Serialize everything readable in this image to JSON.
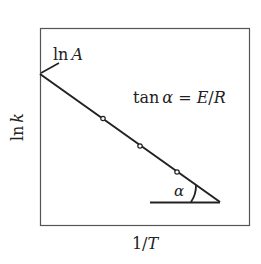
{
  "diagram": {
    "type": "arrhenius-plot",
    "y_axis_label": {
      "fn": "ln",
      "var": "k"
    },
    "x_axis_label": {
      "num": "1/",
      "var": "T"
    },
    "intercept_label": {
      "fn": "ln",
      "var": "A"
    },
    "slope_equation": {
      "fn": "tan",
      "angle": "α",
      "eq": " = ",
      "lhs": "E",
      "sep": "/",
      "rhs": "R"
    },
    "angle_label": "α",
    "line_color": "#222222",
    "points": [
      {
        "x": 103,
        "y": 118
      },
      {
        "x": 140,
        "y": 146
      },
      {
        "x": 177,
        "y": 172
      }
    ]
  }
}
